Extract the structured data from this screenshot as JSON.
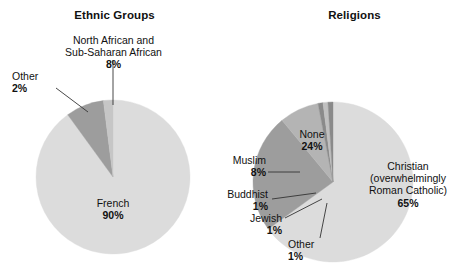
{
  "chart_data": [
    {
      "type": "pie",
      "title": "Ethnic Groups",
      "categories": [
        "French",
        "North African and Sub-Saharan African",
        "Other"
      ],
      "values": [
        90,
        8,
        2
      ],
      "unit": "%",
      "legend": "none",
      "slice_colors": [
        "#dcdcdc",
        "#9d9d9d",
        "#c6c6c6"
      ],
      "labels": [
        {
          "name": "French",
          "pct": "90%",
          "placement": "inside"
        },
        {
          "name_line1": "North African and",
          "name_line2": "Sub-Saharan African",
          "pct": "8%",
          "placement": "callout-top"
        },
        {
          "name": "Other",
          "pct": "2%",
          "placement": "callout-left"
        }
      ]
    },
    {
      "type": "pie",
      "title": "Religions",
      "categories": [
        "Christian (overwhelmingly Roman Catholic)",
        "None",
        "Muslim",
        "Buddhist",
        "Jewish",
        "Other"
      ],
      "values": [
        65,
        24,
        8,
        1,
        1,
        1
      ],
      "unit": "%",
      "legend": "none",
      "slice_colors": [
        "#dcdcdc",
        "#9d9d9d",
        "#b4b4b4",
        "#8a8a8a",
        "#c0c0c0",
        "#8a8a8a"
      ],
      "labels": [
        {
          "name_line1": "Christian",
          "name_line2": "(overwhelmingly",
          "name_line3": "Roman Catholic)",
          "pct": "65%",
          "placement": "inside"
        },
        {
          "name": "None",
          "pct": "24%",
          "placement": "inside"
        },
        {
          "name": "Muslim",
          "pct": "8%",
          "placement": "callout-left"
        },
        {
          "name": "Buddhist",
          "pct": "1%",
          "placement": "callout-left"
        },
        {
          "name": "Jewish",
          "pct": "1%",
          "placement": "callout-left"
        },
        {
          "name": "Other",
          "pct": "1%",
          "placement": "callout-bottom"
        }
      ]
    }
  ],
  "ethnic": {
    "title": "Ethnic Groups",
    "french_name": "French",
    "french_pct": "90%",
    "african_line1": "North African and",
    "african_line2": "Sub-Saharan African",
    "african_pct": "8%",
    "other_name": "Other",
    "other_pct": "2%"
  },
  "religions": {
    "title": "Religions",
    "christian_line1": "Christian",
    "christian_line2": "(overwhelmingly",
    "christian_line3": "Roman Catholic)",
    "christian_pct": "65%",
    "none_name": "None",
    "none_pct": "24%",
    "muslim_name": "Muslim",
    "muslim_pct": "8%",
    "buddhist_name": "Buddhist",
    "buddhist_pct": "1%",
    "jewish_name": "Jewish",
    "jewish_pct": "1%",
    "other_name": "Other",
    "other_pct": "1%"
  },
  "colors": {
    "slice_light": "#dcdcdc",
    "slice_mid": "#b4b4b4",
    "slice_dark": "#9d9d9d",
    "slice_darker": "#8a8a8a",
    "text": "#111111",
    "leader": "#333333",
    "background": "#ffffff"
  }
}
